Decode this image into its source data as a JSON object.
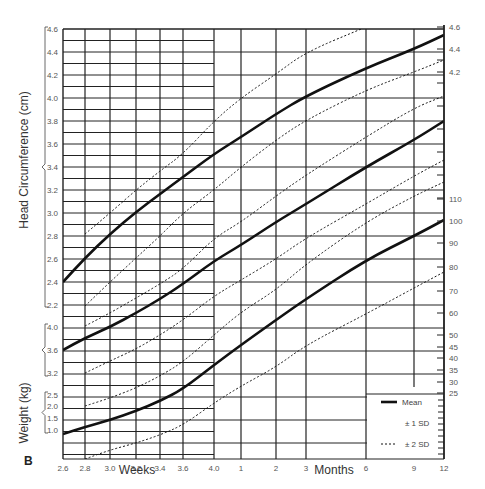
{
  "chart_data": {
    "type": "line",
    "title": "",
    "panel_label": "B",
    "x_axis": {
      "weeks_label": "Weeks",
      "months_label": "Months",
      "ticks": [
        {
          "label": "2.6",
          "x": 63
        },
        {
          "label": "2.8",
          "x": 85
        },
        {
          "label": "3.0",
          "x": 110
        },
        {
          "label": "3.2",
          "x": 136
        },
        {
          "label": "3.4",
          "x": 160
        },
        {
          "label": "3.6",
          "x": 183
        },
        {
          "label": "4.0",
          "x": 214
        },
        {
          "label": "1",
          "x": 241
        },
        {
          "label": "2",
          "x": 276
        },
        {
          "label": "3",
          "x": 306
        },
        {
          "label": "6",
          "x": 366
        },
        {
          "label": "9",
          "x": 414
        },
        {
          "label": "12",
          "x": 444
        }
      ]
    },
    "y_axes": {
      "head_circumference": {
        "label": "Head Circumference (cm)",
        "ticks": [
          {
            "label": "4.6",
            "y": 29
          },
          {
            "label": "4.4",
            "y": 52
          },
          {
            "label": "4.2",
            "y": 75
          },
          {
            "label": "4.0",
            "y": 98
          },
          {
            "label": "3.8",
            "y": 121
          },
          {
            "label": "3.6",
            "y": 144
          },
          {
            "label": "3.4",
            "y": 167
          },
          {
            "label": "3.2",
            "y": 190
          },
          {
            "label": "3.0",
            "y": 213
          },
          {
            "label": "2.8",
            "y": 236
          },
          {
            "label": "2.6",
            "y": 259
          },
          {
            "label": "2.4",
            "y": 282
          },
          {
            "label": "2.2",
            "y": 305
          }
        ]
      },
      "length": {
        "label": "",
        "ticks": [
          {
            "label": "4.0",
            "y": 327
          },
          {
            "label": "3.6",
            "y": 350
          },
          {
            "label": "3.2",
            "y": 373
          }
        ]
      },
      "weight": {
        "label": "Weight (kg)",
        "ticks": [
          {
            "label": "2.5",
            "y": 395
          },
          {
            "label": "2.0",
            "y": 406
          },
          {
            "label": "1.5",
            "y": 418
          },
          {
            "label": "1.0",
            "y": 430
          }
        ]
      },
      "right": {
        "ticks": [
          {
            "label": "4.6",
            "y": 27
          },
          {
            "label": "4.4",
            "y": 49
          },
          {
            "label": "4.2",
            "y": 72
          },
          {
            "label": "110",
            "y": 199
          },
          {
            "label": "100",
            "y": 221
          },
          {
            "label": "90",
            "y": 243
          },
          {
            "label": "80",
            "y": 267
          },
          {
            "label": "70",
            "y": 291
          },
          {
            "label": "60",
            "y": 313
          },
          {
            "label": "50",
            "y": 335
          },
          {
            "label": "45",
            "y": 347
          },
          {
            "label": "40",
            "y": 358
          },
          {
            "label": "35",
            "y": 370
          },
          {
            "label": "30",
            "y": 382
          },
          {
            "label": "25",
            "y": 393
          }
        ]
      }
    },
    "legend": [
      {
        "label": "Mean",
        "style": "solid-thick"
      },
      {
        "label": "± 1 SD",
        "style": "none"
      },
      {
        "label": "± 2 SD",
        "style": "dotted"
      }
    ],
    "series": [
      {
        "name": "Head circumference mean",
        "style": "mean",
        "points": [
          [
            63,
            282
          ],
          [
            85,
            258
          ],
          [
            110,
            234
          ],
          [
            136,
            212
          ],
          [
            160,
            194
          ],
          [
            183,
            177
          ],
          [
            214,
            154
          ],
          [
            241,
            137
          ],
          [
            276,
            114
          ],
          [
            306,
            96
          ],
          [
            366,
            68
          ],
          [
            414,
            49
          ],
          [
            444,
            35
          ]
        ]
      },
      {
        "name": "Head circumference +2SD",
        "style": "sd",
        "points": [
          [
            85,
            234
          ],
          [
            110,
            213
          ],
          [
            136,
            190
          ],
          [
            160,
            171
          ],
          [
            183,
            154
          ],
          [
            214,
            121
          ],
          [
            241,
            98
          ],
          [
            276,
            74
          ],
          [
            306,
            52
          ],
          [
            366,
            27
          ]
        ]
      },
      {
        "name": "Head circumference -2SD",
        "style": "sd",
        "points": [
          [
            85,
            306
          ],
          [
            110,
            282
          ],
          [
            136,
            258
          ],
          [
            160,
            236
          ],
          [
            183,
            213
          ],
          [
            214,
            190
          ],
          [
            241,
            167
          ],
          [
            276,
            140
          ],
          [
            306,
            120
          ],
          [
            366,
            90
          ],
          [
            414,
            72
          ],
          [
            444,
            60
          ]
        ]
      },
      {
        "name": "Length mean",
        "style": "mean",
        "points": [
          [
            63,
            350
          ],
          [
            85,
            338
          ],
          [
            110,
            327
          ],
          [
            136,
            313
          ],
          [
            160,
            299
          ],
          [
            183,
            284
          ],
          [
            214,
            261
          ],
          [
            241,
            245
          ],
          [
            276,
            222
          ],
          [
            306,
            204
          ],
          [
            366,
            167
          ],
          [
            414,
            140
          ],
          [
            444,
            121
          ]
        ]
      },
      {
        "name": "Length +2SD",
        "style": "sd",
        "points": [
          [
            85,
            326
          ],
          [
            110,
            313
          ],
          [
            136,
            298
          ],
          [
            160,
            284
          ],
          [
            183,
            269
          ],
          [
            214,
            238
          ],
          [
            241,
            222
          ],
          [
            276,
            196
          ],
          [
            306,
            175
          ],
          [
            366,
            137
          ],
          [
            414,
            108
          ],
          [
            444,
            96
          ]
        ]
      },
      {
        "name": "Length -2SD",
        "style": "sd",
        "points": [
          [
            85,
            373
          ],
          [
            110,
            361
          ],
          [
            136,
            349
          ],
          [
            160,
            335
          ],
          [
            183,
            320
          ],
          [
            214,
            296
          ],
          [
            241,
            280
          ],
          [
            276,
            259
          ],
          [
            306,
            238
          ],
          [
            366,
            204
          ],
          [
            414,
            176
          ],
          [
            444,
            160
          ]
        ]
      },
      {
        "name": "Weight mean",
        "style": "mean",
        "points": [
          [
            63,
            434
          ],
          [
            85,
            427
          ],
          [
            110,
            420
          ],
          [
            136,
            411
          ],
          [
            160,
            401
          ],
          [
            183,
            389
          ],
          [
            214,
            365
          ],
          [
            241,
            345
          ],
          [
            276,
            320
          ],
          [
            306,
            299
          ],
          [
            366,
            260
          ],
          [
            414,
            236
          ],
          [
            444,
            220
          ]
        ]
      },
      {
        "name": "Weight +2SD",
        "style": "sd",
        "points": [
          [
            85,
            406
          ],
          [
            110,
            398
          ],
          [
            136,
            388
          ],
          [
            160,
            376
          ],
          [
            183,
            362
          ],
          [
            214,
            335
          ],
          [
            241,
            312
          ],
          [
            276,
            290
          ],
          [
            306,
            264
          ],
          [
            366,
            222
          ],
          [
            414,
            196
          ],
          [
            444,
            182
          ]
        ]
      },
      {
        "name": "Weight -2SD",
        "style": "sd",
        "points": [
          [
            85,
            459
          ],
          [
            110,
            450
          ],
          [
            136,
            443
          ],
          [
            160,
            435
          ],
          [
            183,
            425
          ],
          [
            214,
            403
          ],
          [
            241,
            386
          ],
          [
            276,
            367
          ],
          [
            306,
            345
          ],
          [
            366,
            314
          ],
          [
            414,
            288
          ],
          [
            444,
            272
          ]
        ]
      }
    ],
    "grid": true
  }
}
